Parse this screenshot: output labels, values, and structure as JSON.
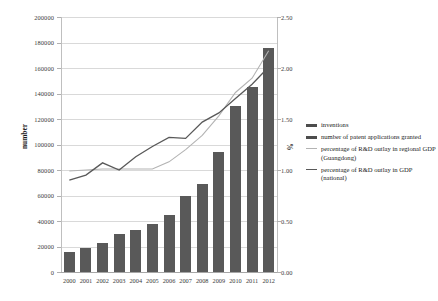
{
  "chart_data": {
    "type": "bar",
    "title": "",
    "subtitle": "",
    "xlabel": "",
    "ylabel": "number",
    "y2label": "%",
    "grid": true,
    "legend_position": "right",
    "categories": [
      "2000",
      "2001",
      "2002",
      "2003",
      "2004",
      "2005",
      "2006",
      "2007",
      "2008",
      "2009",
      "2010",
      "2011",
      "2012"
    ],
    "ylim": [
      0,
      200000
    ],
    "ytick_labels": [
      "200000",
      "180000",
      "160000",
      "140000",
      "120000",
      "100000",
      "80000",
      "60000",
      "40000",
      "20000",
      "0"
    ],
    "ytick_values": [
      200000,
      180000,
      160000,
      140000,
      120000,
      100000,
      80000,
      60000,
      40000,
      20000,
      0
    ],
    "y2lim": [
      0,
      2.5
    ],
    "y2tick_labels": [
      "2.50",
      "2.00",
      "1.50",
      "1.00",
      "0.50",
      "0.00"
    ],
    "y2tick_values": [
      2.5,
      2.0,
      1.5,
      1.0,
      0.5,
      0.0
    ],
    "series": [
      {
        "name": "number of patent applications granted",
        "type": "bar",
        "axis": "left",
        "color": "#595959",
        "values": [
          16000,
          18500,
          22500,
          29500,
          33000,
          38000,
          45000,
          59500,
          69000,
          94500,
          130500,
          145000,
          176000
        ]
      },
      {
        "name": "percentage of R&D outlay in GDP (national)",
        "type": "line",
        "axis": "right",
        "color": "#595959",
        "values": [
          0.9,
          0.95,
          1.07,
          1.0,
          1.13,
          1.23,
          1.32,
          1.31,
          1.47,
          1.56,
          1.7,
          1.84,
          2.01
        ]
      },
      {
        "name": "percentage of R&D outlay in regional GDP (Guangdong)",
        "type": "line",
        "axis": "right",
        "color": "#b3b3b3",
        "values": [
          0.99,
          1.0,
          1.01,
          1.01,
          1.01,
          1.01,
          1.08,
          1.2,
          1.34,
          1.53,
          1.76,
          1.9,
          2.17
        ]
      }
    ],
    "legend": [
      {
        "label": "inventions",
        "marker": "thick-dark",
        "color": "#4d4d4d"
      },
      {
        "label": "number of patent applications granted",
        "marker": "thick-dark",
        "color": "#4d4d4d"
      },
      {
        "label": "percentage of R&D outlay in regional GDP (Guangdong)",
        "marker": "thin-light",
        "color": "#b3b3b3"
      },
      {
        "label": "percentage of R&D outlay in GDP (national)",
        "marker": "thin-dark",
        "color": "#595959"
      }
    ]
  }
}
